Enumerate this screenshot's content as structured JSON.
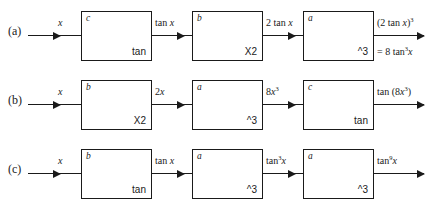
{
  "diagram": {
    "type": "block-diagram",
    "rows": [
      {
        "label": "(a)",
        "input": "x",
        "blocks": [
          {
            "letter": "c",
            "op": "tan"
          },
          {
            "letter": "b",
            "op": "X2"
          },
          {
            "letter": "a",
            "op": "^3"
          }
        ],
        "intermediates": [
          "tan x",
          "2 tan x"
        ],
        "output": "(2 tan x)³",
        "output_alt": "= 8 tan³x"
      },
      {
        "label": "(b)",
        "input": "x",
        "blocks": [
          {
            "letter": "b",
            "op": "X2"
          },
          {
            "letter": "a",
            "op": "^3"
          },
          {
            "letter": "c",
            "op": "tan"
          }
        ],
        "intermediates": [
          "2x",
          "8x³"
        ],
        "output": "tan (8x³)",
        "output_alt": ""
      },
      {
        "label": "(c)",
        "input": "x",
        "blocks": [
          {
            "letter": "b",
            "op": "tan"
          },
          {
            "letter": "a",
            "op": "^3"
          },
          {
            "letter": "a",
            "op": "^3"
          }
        ],
        "intermediates": [
          "tan x",
          "tan³x"
        ],
        "output": "tan⁹x",
        "output_alt": ""
      }
    ],
    "colors": {
      "stroke": "#1a1a1a",
      "background": "#ffffff"
    }
  }
}
